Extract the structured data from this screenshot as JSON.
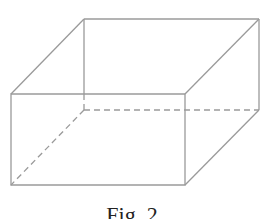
{
  "figure": {
    "caption": "Fig. 2",
    "line_color": "#9a9a9a",
    "vertices": {
      "front_top_left": [
        11,
        94
      ],
      "front_top_right": [
        185,
        94
      ],
      "front_bottom_right": [
        185,
        185
      ],
      "front_bottom_left": [
        11,
        185
      ],
      "back_top_left": [
        84,
        19
      ],
      "back_top_right": [
        259,
        19
      ],
      "back_bottom_right": [
        259,
        110
      ],
      "back_bottom_left": [
        84,
        110
      ]
    },
    "visible_edges": [
      [
        "front_top_left",
        "front_top_right"
      ],
      [
        "front_top_right",
        "front_bottom_right"
      ],
      [
        "front_bottom_right",
        "front_bottom_left"
      ],
      [
        "front_bottom_left",
        "front_top_left"
      ],
      [
        "front_top_left",
        "back_top_left"
      ],
      [
        "back_top_left",
        "back_top_right"
      ],
      [
        "front_top_right",
        "back_top_right"
      ],
      [
        "back_top_right",
        "back_bottom_right"
      ],
      [
        "back_bottom_right",
        "front_bottom_right"
      ],
      [
        "back_top_left",
        "front_top_left_line_segment_upper"
      ]
    ],
    "hidden_edges": [
      [
        "back_bottom_left",
        "front_bottom_left"
      ],
      [
        "back_bottom_left",
        "back_bottom_right"
      ],
      [
        "back_bottom_left",
        "back_top_left_lower_segment"
      ]
    ]
  }
}
